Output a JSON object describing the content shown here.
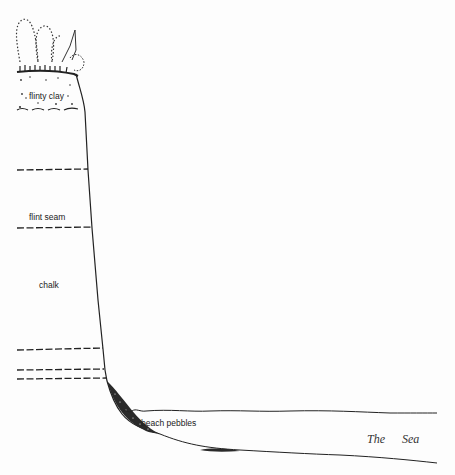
{
  "diagram": {
    "type": "geological cross-section of a chalk sea cliff",
    "labels": {
      "flinty_clay": "flinty clay",
      "flint_seam": "flint seam",
      "chalk": "chalk",
      "beach_pebbles": "beach pebbles",
      "sea_word1": "The",
      "sea_word2": "Sea"
    },
    "layers": [
      {
        "name": "vegetation / topsoil",
        "y": 68
      },
      {
        "name": "flinty clay base",
        "y": 108
      },
      {
        "name": "flint band 1",
        "y": 170
      },
      {
        "name": "flint seam",
        "y": 228
      },
      {
        "name": "flint band 3",
        "y": 349
      },
      {
        "name": "flint band 4",
        "y": 370
      },
      {
        "name": "flint band 5",
        "y": 379
      }
    ],
    "colors": {
      "ink": "#222222",
      "background": "#fdfdfd"
    }
  }
}
